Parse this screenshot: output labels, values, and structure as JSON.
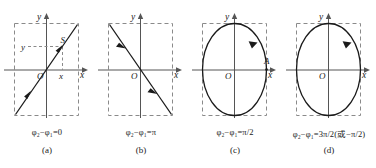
{
  "figure": {
    "background": "#ffffff",
    "curve_color": "#1a1a1a",
    "axis_color": "#555555",
    "dash_color": "#8a8a8a"
  },
  "panels": [
    {
      "id": "a",
      "label": "(a)",
      "equation": "φ₂−φ₁=0",
      "shape": "line-positive-slope",
      "origin_label": "O",
      "x_axis_label": "x",
      "y_axis_label": "y",
      "point_label": "S",
      "x_value_label": "x",
      "y_value_label": "y"
    },
    {
      "id": "b",
      "label": "(b)",
      "equation": "φ₂−φ₁=π",
      "shape": "line-negative-slope",
      "origin_label": "O",
      "x_axis_label": "x",
      "y_axis_label": "y"
    },
    {
      "id": "c",
      "label": "(c)",
      "equation": "φ₂−φ₁=π/2",
      "shape": "ellipse-vertical",
      "origin_label": "O",
      "x_axis_label": "x",
      "y_axis_label": "y",
      "point_label": "A"
    },
    {
      "id": "d",
      "label": "(d)",
      "equation": "φ₂−φ₁=3π/2(或−π/2)",
      "shape": "ellipse-vertical",
      "origin_label": "O",
      "x_axis_label": "x",
      "y_axis_label": "y"
    }
  ]
}
